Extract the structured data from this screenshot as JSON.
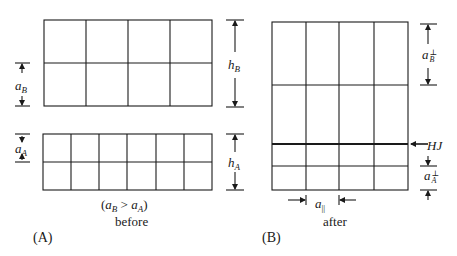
{
  "panels": {
    "A": {
      "label": "(A)",
      "caption": "before",
      "condition": "(a_B > a_A)",
      "grid_B": {
        "rows": 2,
        "cols": 4
      },
      "grid_A": {
        "rows": 2,
        "cols": 6
      },
      "dims": {
        "a_B": {
          "base": "a",
          "sub": "B"
        },
        "a_A": {
          "base": "a",
          "sub": "A"
        },
        "h_B": {
          "base": "h",
          "sub": "B"
        },
        "h_A": {
          "base": "h",
          "sub": "A"
        }
      },
      "condition_parts": {
        "open": "(",
        "a1": "a",
        "s1": "B",
        "gt": " > ",
        "a2": "a",
        "s2": "A",
        "close": ")"
      }
    },
    "B": {
      "label": "(B)",
      "caption": "after",
      "grid": {
        "cols": 4,
        "interface_label": "HJ"
      },
      "dims": {
        "a_B_perp": {
          "base": "a",
          "sup": "⊥",
          "sub": "B"
        },
        "a_A_perp": {
          "base": "a",
          "sup": "⊥",
          "sub": "A"
        },
        "a_par": {
          "base": "a",
          "sub": "||"
        }
      }
    }
  },
  "colors": {
    "line": "#1a1a1a",
    "background": "#ffffff"
  }
}
